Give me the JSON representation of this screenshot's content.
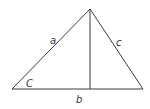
{
  "diagram": {
    "type": "triangle-with-altitude",
    "stroke_color": "#3a3a3a",
    "labels": {
      "side_a": "a",
      "side_b": "b",
      "side_c": "c",
      "angle_C": "C"
    }
  }
}
